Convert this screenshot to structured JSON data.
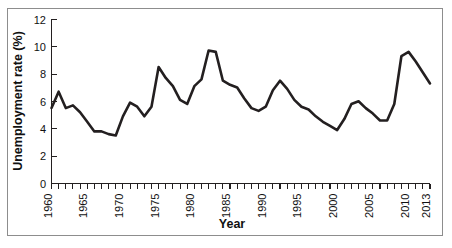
{
  "figure": {
    "border_color": "#8d8d8d",
    "background": "#ffffff"
  },
  "chart_data": {
    "type": "line",
    "title": "",
    "xlabel": "Year",
    "ylabel": "Unemployment rate (%)",
    "xlim": [
      1960,
      2013
    ],
    "ylim": [
      0,
      12
    ],
    "yticks": [
      0,
      2,
      4,
      6,
      8,
      10,
      12
    ],
    "ytick_labels": [
      "0",
      "2",
      "4",
      "6",
      "8",
      "10",
      "12"
    ],
    "xticks": [
      1960,
      1961,
      1962,
      1963,
      1964,
      1965,
      1966,
      1967,
      1968,
      1969,
      1970,
      1971,
      1972,
      1973,
      1974,
      1975,
      1976,
      1977,
      1978,
      1979,
      1980,
      1981,
      1982,
      1983,
      1984,
      1985,
      1986,
      1987,
      1988,
      1989,
      1990,
      1991,
      1992,
      1993,
      1994,
      1995,
      1996,
      1997,
      1998,
      1999,
      2000,
      2001,
      2002,
      2003,
      2004,
      2005,
      2006,
      2007,
      2008,
      2009,
      2010,
      2011,
      2012,
      2013
    ],
    "xtick_labels": [
      "1960",
      "1965",
      "1970",
      "1975",
      "1980",
      "1985",
      "1990",
      "1995",
      "2000",
      "2005",
      "2010",
      "2013"
    ],
    "xtick_label_years": [
      1960,
      1965,
      1970,
      1975,
      1980,
      1985,
      1990,
      1995,
      2000,
      2005,
      2010,
      2013
    ],
    "xtick_label_rotation": -90,
    "grid": false,
    "legend": null,
    "line_color": "#231f20",
    "line_width": 2.6,
    "x": [
      1960,
      1961,
      1962,
      1963,
      1964,
      1965,
      1966,
      1967,
      1968,
      1969,
      1970,
      1971,
      1972,
      1973,
      1974,
      1975,
      1976,
      1977,
      1978,
      1979,
      1980,
      1981,
      1982,
      1983,
      1984,
      1985,
      1986,
      1987,
      1988,
      1989,
      1990,
      1991,
      1992,
      1993,
      1994,
      1995,
      1996,
      1997,
      1998,
      1999,
      2000,
      2001,
      2002,
      2003,
      2004,
      2005,
      2006,
      2007,
      2008,
      2009,
      2010,
      2011,
      2012,
      2013
    ],
    "values": [
      5.5,
      6.7,
      5.5,
      5.7,
      5.2,
      4.5,
      3.8,
      3.8,
      3.6,
      3.5,
      4.9,
      5.9,
      5.6,
      4.9,
      5.6,
      8.5,
      7.7,
      7.1,
      6.1,
      5.8,
      7.1,
      7.6,
      9.7,
      9.6,
      7.5,
      7.2,
      7.0,
      6.2,
      5.5,
      5.3,
      5.6,
      6.8,
      7.5,
      6.9,
      6.1,
      5.6,
      5.4,
      4.9,
      4.5,
      4.2,
      3.9,
      4.7,
      5.8,
      6.0,
      5.5,
      5.1,
      4.6,
      4.6,
      5.8,
      9.3,
      9.6,
      8.9,
      8.1,
      7.3
    ]
  }
}
